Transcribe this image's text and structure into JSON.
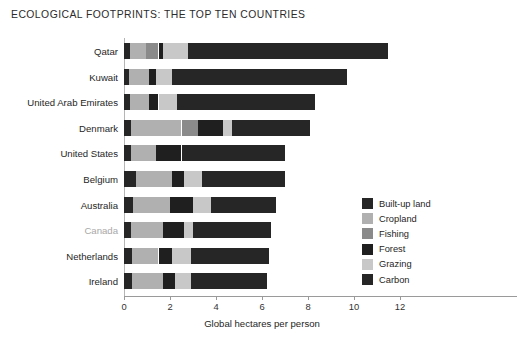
{
  "chart_data": {
    "type": "bar",
    "orientation": "horizontal",
    "stacked": true,
    "title": "ECOLOGICAL FOOTPRINTS: THE TOP TEN COUNTRIES",
    "xlabel": "Global hectares per person",
    "ylabel": "",
    "xlim": [
      0,
      12.6
    ],
    "xticks": [
      0,
      2,
      4,
      6,
      8,
      10,
      12
    ],
    "xtick_labels": [
      "0",
      "2",
      "4",
      "6",
      "8",
      "10",
      "12"
    ],
    "grid": false,
    "legend_position": "inside-right",
    "categories": [
      "Qatar",
      "Kuwait",
      "United Arab Emirates",
      "Denmark",
      "United States",
      "Belgium",
      "Australia",
      "Canada",
      "Netherlands",
      "Ireland"
    ],
    "highlighted_category": "Canada",
    "series": [
      {
        "name": "Built-up land",
        "color": "#262626",
        "values": [
          0.25,
          0.2,
          0.25,
          0.3,
          0.3,
          0.5,
          0.4,
          0.3,
          0.35,
          0.35
        ]
      },
      {
        "name": "Cropland",
        "color": "#b0b0b0",
        "values": [
          0.7,
          0.9,
          0.85,
          2.2,
          1.1,
          1.6,
          1.6,
          1.4,
          1.15,
          1.35
        ]
      },
      {
        "name": "Fishing",
        "color": "#8a8a8a",
        "values": [
          0.55,
          0.0,
          0.0,
          0.7,
          0.0,
          0.0,
          0.0,
          0.0,
          0.0,
          0.0
        ]
      },
      {
        "name": "Forest",
        "color": "#1f1f1f",
        "values": [
          0.2,
          0.3,
          0.4,
          1.1,
          1.1,
          0.5,
          1.0,
          0.9,
          0.6,
          0.5
        ]
      },
      {
        "name": "Grazing",
        "color": "#c8c8c8",
        "values": [
          1.1,
          0.7,
          0.8,
          0.4,
          0.0,
          0.8,
          0.8,
          0.4,
          0.8,
          0.7
        ],
        "note": "light grey band"
      },
      {
        "name": "Carbon",
        "color": "#262626",
        "values": [
          8.7,
          7.6,
          6.0,
          3.4,
          4.5,
          3.6,
          2.8,
          3.4,
          3.4,
          3.3
        ]
      }
    ],
    "totals": [
      11.5,
      9.7,
      8.3,
      8.1,
      7.0,
      7.0,
      6.6,
      6.4,
      6.3,
      6.2
    ]
  },
  "legend": {
    "items": [
      {
        "label": "Built-up land",
        "color": "#262626"
      },
      {
        "label": "Cropland",
        "color": "#b0b0b0"
      },
      {
        "label": "Fishing",
        "color": "#8a8a8a"
      },
      {
        "label": "Forest",
        "color": "#1f1f1f"
      },
      {
        "label": "Grazing",
        "color": "#c8c8c8"
      },
      {
        "label": "Carbon",
        "color": "#262626"
      }
    ]
  }
}
